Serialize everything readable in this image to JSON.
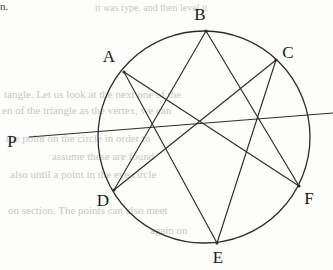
{
  "figure": {
    "stroke_color": "#2c2c2c",
    "background_color": "#fdfdfc",
    "label_color": "#1a1a1a",
    "circle": {
      "cx": 204,
      "cy": 137,
      "r": 106,
      "stroke_width": 1.3
    },
    "points": [
      {
        "id": "A",
        "label": "A",
        "x": 124,
        "y": 72,
        "label_x": 109,
        "label_y": 62
      },
      {
        "id": "B",
        "label": "B",
        "x": 206,
        "y": 31,
        "label_x": 200,
        "label_y": 20
      },
      {
        "id": "C",
        "label": "C",
        "x": 276,
        "y": 60,
        "label_x": 288,
        "label_y": 58
      },
      {
        "id": "D",
        "label": "D",
        "x": 114,
        "y": 190,
        "label_x": 103,
        "label_y": 206
      },
      {
        "id": "E",
        "label": "E",
        "x": 217,
        "y": 243,
        "label_x": 218,
        "label_y": 263
      },
      {
        "id": "F",
        "label": "F",
        "x": 299,
        "y": 186,
        "label_x": 309,
        "label_y": 204
      },
      {
        "id": "P",
        "label": "P",
        "x": 29,
        "y": 137,
        "label_x": 12,
        "label_y": 147
      }
    ],
    "chords": [
      {
        "id": "AE",
        "from": "A",
        "to": "E"
      },
      {
        "id": "AF",
        "from": "A",
        "to": "F"
      },
      {
        "id": "BD",
        "from": "B",
        "to": "D"
      },
      {
        "id": "BF",
        "from": "B",
        "to": "F"
      },
      {
        "id": "CD",
        "from": "C",
        "to": "D"
      },
      {
        "id": "CE",
        "from": "C",
        "to": "E"
      }
    ],
    "secant_line": {
      "id": "P",
      "label": "P",
      "x1": 29,
      "y1": 137,
      "x2": 333,
      "y2": 113
    }
  },
  "background_text": {
    "corner_note": "n.",
    "lines": [
      {
        "text": "it was type. and then level it",
        "x": 95,
        "y": 10,
        "size": 10
      },
      {
        "text": "tangle. Let us look at the next one of the",
        "x": 4,
        "y": 96,
        "size": 11
      },
      {
        "text": "en of the triangle as the vertex, we can",
        "x": 2,
        "y": 112,
        "size": 11
      },
      {
        "text": "the point on the circle in order to",
        "x": 6,
        "y": 140,
        "size": 11
      },
      {
        "text": "assume these are found",
        "x": 52,
        "y": 158,
        "size": 11
      },
      {
        "text": "also until a point in the eye circle",
        "x": 10,
        "y": 176,
        "size": 11
      },
      {
        "text": "on section. The points can also meet",
        "x": 8,
        "y": 212,
        "size": 11
      },
      {
        "text": "again on",
        "x": 150,
        "y": 232,
        "size": 11
      }
    ]
  }
}
